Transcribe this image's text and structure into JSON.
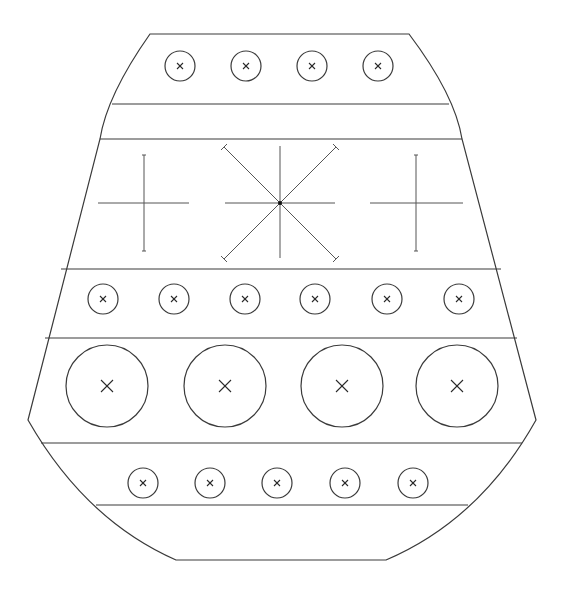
{
  "drawing": {
    "title": "",
    "stroke_color": "#3a3a3a",
    "background": "#ffffff",
    "outline": {
      "top_left": [
        150,
        34
      ],
      "top_right": [
        409,
        34
      ],
      "widest_left": [
        28,
        420
      ],
      "widest_right": [
        536,
        420
      ],
      "bottom_left": [
        176,
        560
      ],
      "bottom_right": [
        386,
        560
      ]
    },
    "bands": [
      {
        "y": 104,
        "x1": 112,
        "x2": 449
      },
      {
        "y": 139,
        "x1": 100,
        "x2": 462
      },
      {
        "y": 269,
        "x1": 61,
        "x2": 501
      },
      {
        "y": 338,
        "x1": 45,
        "x2": 517
      },
      {
        "y": 443,
        "x1": 41,
        "x2": 522
      },
      {
        "y": 505,
        "x1": 96,
        "x2": 468
      }
    ],
    "rows": [
      {
        "name": "top-row",
        "y": 66,
        "r": 15,
        "mark": 3,
        "x": [
          180,
          246,
          312,
          378
        ]
      },
      {
        "name": "middle-small-row",
        "y": 299,
        "r": 15,
        "mark": 3,
        "x": [
          103,
          174,
          245,
          315,
          387,
          459
        ]
      },
      {
        "name": "large-row",
        "y": 386,
        "r": 41,
        "mark": 6,
        "x": [
          107,
          225,
          342,
          457
        ]
      },
      {
        "name": "bottom-row",
        "y": 483,
        "r": 15,
        "mark": 3,
        "x": [
          143,
          210,
          277,
          345,
          413
        ]
      }
    ],
    "crosses": [
      {
        "name": "left-cross",
        "cx": 144,
        "cy": 203,
        "h": [
          98,
          189
        ],
        "v": [
          155,
          251
        ]
      },
      {
        "name": "right-cross",
        "cx": 416,
        "cy": 203,
        "h": [
          370,
          463
        ],
        "v": [
          155,
          251
        ]
      }
    ],
    "star": {
      "cx": 280,
      "cy": 203,
      "h": [
        225,
        335
      ],
      "v": [
        146,
        258
      ],
      "diag_extent": 56
    }
  }
}
